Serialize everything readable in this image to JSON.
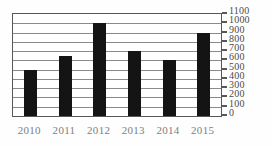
{
  "chart_data": {
    "type": "bar",
    "title": "",
    "subtitle": "",
    "xlabel": "",
    "ylabel": "",
    "categories": [
      "2010",
      "2011",
      "2012",
      "2013",
      "2014",
      "2015"
    ],
    "values": [
      500,
      650,
      1000,
      700,
      600,
      900
    ],
    "series": [
      {
        "name": "",
        "values": [
          500,
          650,
          1000,
          700,
          600,
          900
        ]
      }
    ],
    "ylim": [
      0,
      1100
    ],
    "ytick_step": 100,
    "yticks": [
      0,
      100,
      200,
      300,
      400,
      500,
      600,
      700,
      800,
      900,
      1000,
      1100
    ],
    "ytick_labels": [
      "0",
      "100",
      "200",
      "300",
      "400",
      "500",
      "600",
      "700",
      "800",
      "900",
      "1000",
      "1100"
    ],
    "grid": true,
    "grid_axis": "y",
    "legend": false,
    "legend_position": "none",
    "annotations": [],
    "bar_color": "#141414",
    "gridline_color": "#8a8a8a",
    "frame_color": "#575757",
    "ytick_label_color": "#4a4a4a",
    "xtick_label_color": "#7d7d7d",
    "background_color": "#ffffff",
    "y_axis_position": "right"
  }
}
